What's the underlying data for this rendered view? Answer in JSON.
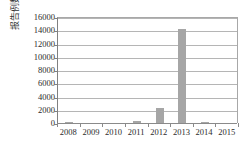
{
  "chart_data": {
    "type": "bar",
    "title": "",
    "subtitle": "",
    "xlabel": "",
    "ylabel": "报告例数",
    "categories": [
      "2008",
      "2009",
      "2010",
      "2011",
      "2012",
      "2013",
      "2014",
      "2015"
    ],
    "values": [
      60,
      0,
      0,
      250,
      2300,
      14200,
      180,
      0
    ],
    "series": [
      {
        "name": "报告例数",
        "values": [
          60,
          0,
          0,
          250,
          2300,
          14200,
          180,
          0
        ]
      }
    ],
    "ylim": [
      0,
      16000
    ],
    "ytick_values": [
      0,
      2000,
      4000,
      6000,
      8000,
      10000,
      12000,
      14000,
      16000
    ],
    "ytick_labels": [
      "0",
      "2000",
      "4000",
      "6000",
      "8000",
      "10000",
      "12000",
      "14000",
      "16000"
    ],
    "grid": true,
    "grid_axis": "y",
    "legend": false,
    "legend_position": "none",
    "bar_color": "#a6a6a6",
    "gridline_color": "#b5b5b5",
    "axis_color": "#808080",
    "background_color": "#ffffff",
    "text_color": "#2b2b2b"
  }
}
